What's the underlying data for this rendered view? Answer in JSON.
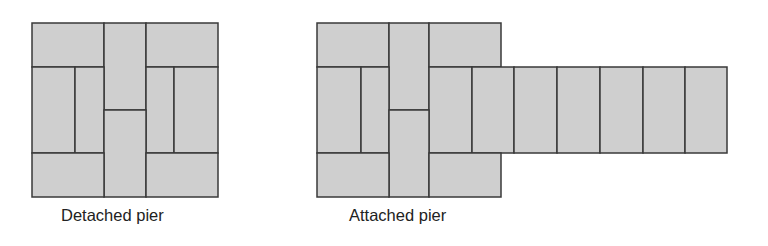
{
  "figures": [
    {
      "name": "detached-pier",
      "caption": "Detached pier",
      "bricks": [
        {
          "x": 32,
          "y": 23,
          "w": 72,
          "h": 44
        },
        {
          "x": 104,
          "y": 23,
          "w": 42,
          "h": 87
        },
        {
          "x": 146,
          "y": 23,
          "w": 72,
          "h": 44
        },
        {
          "x": 32,
          "y": 67,
          "w": 43,
          "h": 86
        },
        {
          "x": 75,
          "y": 67,
          "w": 29,
          "h": 86
        },
        {
          "x": 146,
          "y": 67,
          "w": 28,
          "h": 86
        },
        {
          "x": 174,
          "y": 67,
          "w": 44,
          "h": 86
        },
        {
          "x": 104,
          "y": 110,
          "w": 42,
          "h": 87
        },
        {
          "x": 32,
          "y": 153,
          "w": 72,
          "h": 44
        },
        {
          "x": 146,
          "y": 153,
          "w": 72,
          "h": 44
        }
      ]
    },
    {
      "name": "attached-pier",
      "caption": "Attached pier",
      "bricks": [
        {
          "x": 317,
          "y": 23,
          "w": 72,
          "h": 44
        },
        {
          "x": 389,
          "y": 23,
          "w": 40,
          "h": 87
        },
        {
          "x": 429,
          "y": 23,
          "w": 72,
          "h": 44
        },
        {
          "x": 317,
          "y": 67,
          "w": 44,
          "h": 86
        },
        {
          "x": 361,
          "y": 67,
          "w": 28,
          "h": 86
        },
        {
          "x": 429,
          "y": 67,
          "w": 43,
          "h": 86
        },
        {
          "x": 472,
          "y": 67,
          "w": 42,
          "h": 86
        },
        {
          "x": 514,
          "y": 67,
          "w": 43,
          "h": 86
        },
        {
          "x": 557,
          "y": 67,
          "w": 43,
          "h": 86
        },
        {
          "x": 600,
          "y": 67,
          "w": 43,
          "h": 86
        },
        {
          "x": 643,
          "y": 67,
          "w": 42,
          "h": 86
        },
        {
          "x": 685,
          "y": 67,
          "w": 42,
          "h": 86
        },
        {
          "x": 389,
          "y": 110,
          "w": 40,
          "h": 87
        },
        {
          "x": 317,
          "y": 153,
          "w": 72,
          "h": 44
        },
        {
          "x": 429,
          "y": 153,
          "w": 72,
          "h": 44
        }
      ]
    }
  ],
  "colors": {
    "brick_fill": "#cfcfcf",
    "mortar": "#3a3a3a"
  }
}
